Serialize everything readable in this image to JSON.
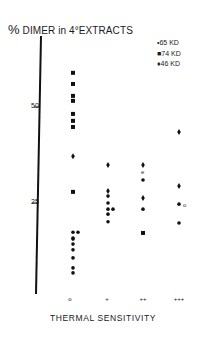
{
  "chart_data": {
    "type": "scatter",
    "title": "% DIMER in 4°EXTRACTS",
    "ylabel": "% DIMER in 4°EXTRACTS",
    "xlabel": "THERMAL SENSITIVITY",
    "categories": [
      "0",
      "+",
      "++",
      "+++"
    ],
    "y_ticks": [
      25,
      50
    ],
    "ylim": [
      0,
      62
    ],
    "grid": false,
    "legend_position": "top-right",
    "legend": [
      {
        "symbol": "•",
        "shape": "circle",
        "label": "65 KD"
      },
      {
        "symbol": "■",
        "shape": "square",
        "label": "74 KD"
      },
      {
        "symbol": "♦",
        "shape": "diamond",
        "label": "46 KD"
      }
    ],
    "series": [
      {
        "name": "65 KD",
        "shape": "circle",
        "points": [
          {
            "x": "0",
            "y": 17.4
          },
          {
            "x": "0",
            "y": 17.4
          },
          {
            "x": "0",
            "y": 15.9
          },
          {
            "x": "0",
            "y": 15.6
          },
          {
            "x": "0",
            "y": 14.3
          },
          {
            "x": "0",
            "y": 12.8
          },
          {
            "x": "0",
            "y": 10.7
          },
          {
            "x": "0",
            "y": 8.1
          },
          {
            "x": "0",
            "y": 6.8
          },
          {
            "x": "+",
            "y": 26.8
          },
          {
            "x": "+",
            "y": 25.0
          },
          {
            "x": "+",
            "y": 23.4
          },
          {
            "x": "+",
            "y": 23.4
          },
          {
            "x": "+",
            "y": 22.1
          },
          {
            "x": "+",
            "y": 20.1
          },
          {
            "x": "++",
            "y": 31.0
          },
          {
            "x": "++",
            "y": 23.4
          },
          {
            "x": "+++",
            "y": 24.7
          },
          {
            "x": "+++",
            "y": 19.8
          }
        ]
      },
      {
        "name": "74 KD",
        "shape": "square",
        "points": [
          {
            "x": "0",
            "y": 58.9
          },
          {
            "x": "0",
            "y": 56.0
          },
          {
            "x": "0",
            "y": 52.9
          },
          {
            "x": "0",
            "y": 51.6
          },
          {
            "x": "0",
            "y": 48.2
          },
          {
            "x": "0",
            "y": 46.4
          },
          {
            "x": "0",
            "y": 44.8
          },
          {
            "x": "0",
            "y": 27.9
          },
          {
            "x": "++",
            "y": 17.2
          }
        ]
      },
      {
        "name": "46 KD",
        "shape": "diamond",
        "points": [
          {
            "x": "0",
            "y": 37.2
          },
          {
            "x": "+",
            "y": 34.9
          },
          {
            "x": "+",
            "y": 28.1
          },
          {
            "x": "++",
            "y": 34.9
          },
          {
            "x": "++",
            "y": 26.3
          },
          {
            "x": "+++",
            "y": 43.5
          },
          {
            "x": "+++",
            "y": 29.4
          }
        ]
      }
    ],
    "annotations": [
      {
        "text": "e",
        "x": "++",
        "y": 33.1
      },
      {
        "text": "o",
        "x": "+++",
        "y": 24.7
      }
    ]
  },
  "y_axis": {
    "tick_labels": [
      "50",
      "25"
    ]
  },
  "x_axis": {
    "tick_labels": [
      "o",
      "+",
      "++",
      "+++"
    ]
  }
}
